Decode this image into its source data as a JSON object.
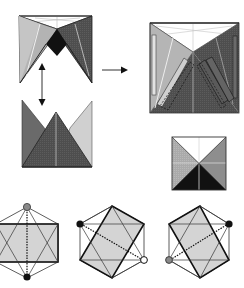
{
  "diagram": {
    "type": "origami-folding-instructions",
    "colors": {
      "background": "#ffffff",
      "light_gray": "#c8c8c8",
      "mid_gray": "#a9a9a9",
      "dark_gray": "#5a5a5a",
      "darker_gray": "#4a4a4a",
      "black": "#111111",
      "white_face": "#ffffff",
      "crease": "#e6e6e6",
      "hex_fill": "#d4d4d4",
      "outline": "#222222"
    },
    "steps": [
      {
        "id": "step-w-fold",
        "label": "Partially folded W-shape with black diamond center"
      },
      {
        "id": "step-crown",
        "label": "Side view: three triangular flaps (crown shape)"
      },
      {
        "id": "step-square-large",
        "label": "Flattened square with dashed flap outlines"
      },
      {
        "id": "step-square-small",
        "label": "Finished square with four triangular faces"
      },
      {
        "id": "hex-1",
        "label": "Hexagon view, horizontal rectangle, vertical dotted axis"
      },
      {
        "id": "hex-2",
        "label": "Hexagon view, tilted rectangle, dotted diagonal to lower-right"
      },
      {
        "id": "hex-3",
        "label": "Hexagon view, tilted rectangle, dotted diagonal to upper-right"
      }
    ],
    "arrows": [
      {
        "id": "double-arrow",
        "direction": "vertical-bidirectional"
      },
      {
        "id": "right-arrow",
        "direction": "right"
      }
    ],
    "markers": {
      "hex_1": {
        "top": "gray-dot",
        "bottom": "black-dot"
      },
      "hex_2": {
        "left": "black-dot",
        "right": "white-dot"
      },
      "hex_3": {
        "left": "gray-dot",
        "right": "black-dot"
      }
    }
  }
}
